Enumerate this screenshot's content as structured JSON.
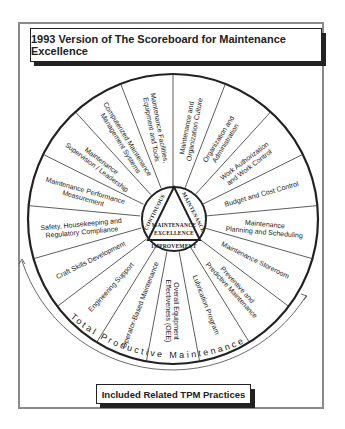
{
  "header": {
    "title": "1993 Version of The Scoreboard for Maintenance Excellence"
  },
  "footer": {
    "label": "Included Related TPM Practices"
  },
  "hub": {
    "left_side": "CONTINUOUS",
    "right_side": "MAINTENANCE",
    "bottom": "IMPROVEMENT",
    "center_line1": "MAINTENANCE",
    "center_line2": "EXCELLENCE"
  },
  "arc_label": "Total Productive Maintenance",
  "segments": [
    {
      "line1": "Maintenance and",
      "line2": "Organization Culture"
    },
    {
      "line1": "Organization and",
      "line2": "Administration"
    },
    {
      "line1": "Work Authorization",
      "line2": "and Work Control"
    },
    {
      "line1": "Budget and Cost Control",
      "line2": ""
    },
    {
      "line1": "Maintenance",
      "line2": "Planning and Scheduling"
    },
    {
      "line1": "Maintenance Storeroom",
      "line2": ""
    },
    {
      "line1": "Preventive and",
      "line2": "Predictive Maintenance"
    },
    {
      "line1": "Lubrication Program",
      "line2": ""
    },
    {
      "line1": "Overall Equipment",
      "line2": "Effectiveness (OEE)"
    },
    {
      "line1": "Operator-Based Maintenance",
      "line2": ""
    },
    {
      "line1": "Engineering Support",
      "line2": ""
    },
    {
      "line1": "Craft Skills Development",
      "line2": ""
    },
    {
      "line1": "Safety, Housekeeping and",
      "line2": "Regulatory Compliance"
    },
    {
      "line1": "Maintenance Performance",
      "line2": "Measurement"
    },
    {
      "line1": "Maintenance",
      "line2": "Supervision / Leadership"
    },
    {
      "line1": "Computerized Maintenance",
      "line2": "Management Systems"
    },
    {
      "line1": "Maintenance Facilities,",
      "line2": "Equipment and Tools"
    }
  ],
  "colors": {
    "ink": "#222222",
    "frame": "#8a8a8a",
    "background": "#ffffff"
  }
}
